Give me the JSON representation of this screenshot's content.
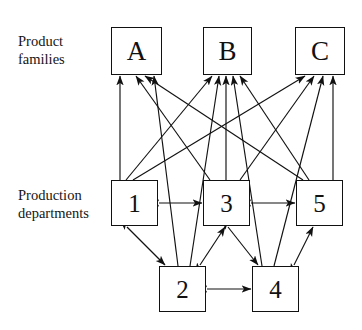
{
  "diagram": {
    "type": "node-link-diagram",
    "background_color": "#ffffff",
    "line_color": "#111111",
    "box_border_color": "#111111",
    "box_fill_color": "#ffffff",
    "row_labels": [
      {
        "id": "label-product-families",
        "text": "Product\nfamilies",
        "x": 18,
        "y": 33
      },
      {
        "id": "label-production-departments",
        "text": "Production\ndepartments",
        "x": 18,
        "y": 187
      }
    ],
    "nodes": [
      {
        "id": "A",
        "label": "A",
        "group": "product-family",
        "x": 111,
        "y": 27,
        "w": 51,
        "h": 48
      },
      {
        "id": "B",
        "label": "B",
        "group": "product-family",
        "x": 203,
        "y": 27,
        "w": 49,
        "h": 48
      },
      {
        "id": "C",
        "label": "C",
        "group": "product-family",
        "x": 295,
        "y": 27,
        "w": 50,
        "h": 48
      },
      {
        "id": "1",
        "label": "1",
        "group": "production-department",
        "x": 111,
        "y": 180,
        "w": 47,
        "h": 46
      },
      {
        "id": "3",
        "label": "3",
        "group": "production-department",
        "x": 203,
        "y": 180,
        "w": 47,
        "h": 46
      },
      {
        "id": "5",
        "label": "5",
        "group": "production-department",
        "x": 296,
        "y": 180,
        "w": 47,
        "h": 46
      },
      {
        "id": "2",
        "label": "2",
        "group": "production-department",
        "x": 159,
        "y": 266,
        "w": 47,
        "h": 46
      },
      {
        "id": "4",
        "label": "4",
        "group": "production-department",
        "x": 252,
        "y": 266,
        "w": 47,
        "h": 46
      }
    ],
    "edges": [
      {
        "from": "1",
        "to": "A",
        "direction": "one-way",
        "x1": 120,
        "y1": 180,
        "x2": 120,
        "y2": 76
      },
      {
        "from": "1",
        "to": "B",
        "direction": "one-way",
        "x1": 126,
        "y1": 180,
        "x2": 212,
        "y2": 76
      },
      {
        "from": "1",
        "to": "C",
        "direction": "one-way",
        "x1": 133,
        "y1": 180,
        "x2": 305,
        "y2": 76
      },
      {
        "from": "3",
        "to": "A",
        "direction": "one-way",
        "x1": 210,
        "y1": 180,
        "x2": 136,
        "y2": 76
      },
      {
        "from": "3",
        "to": "B",
        "direction": "one-way",
        "x1": 226,
        "y1": 180,
        "x2": 226,
        "y2": 76
      },
      {
        "from": "3",
        "to": "C",
        "direction": "one-way",
        "x1": 240,
        "y1": 180,
        "x2": 314,
        "y2": 76
      },
      {
        "from": "5",
        "to": "A",
        "direction": "one-way",
        "x1": 303,
        "y1": 180,
        "x2": 145,
        "y2": 76
      },
      {
        "from": "5",
        "to": "B",
        "direction": "one-way",
        "x1": 309,
        "y1": 180,
        "x2": 240,
        "y2": 76
      },
      {
        "from": "5",
        "to": "C",
        "direction": "one-way",
        "x1": 333,
        "y1": 180,
        "x2": 333,
        "y2": 76
      },
      {
        "from": "2",
        "to": "A",
        "direction": "one-way",
        "x1": 178,
        "y1": 266,
        "x2": 154,
        "y2": 76
      },
      {
        "from": "2",
        "to": "B",
        "direction": "one-way",
        "x1": 190,
        "y1": 266,
        "x2": 219,
        "y2": 76
      },
      {
        "from": "4",
        "to": "B",
        "direction": "one-way",
        "x1": 262,
        "y1": 266,
        "x2": 233,
        "y2": 76
      },
      {
        "from": "4",
        "to": "C",
        "direction": "one-way",
        "x1": 274,
        "y1": 266,
        "x2": 323,
        "y2": 76
      },
      {
        "from": "1",
        "to": "3",
        "direction": "two-way",
        "x1": 159,
        "y1": 203,
        "x2": 202,
        "y2": 203
      },
      {
        "from": "3",
        "to": "5",
        "direction": "two-way",
        "x1": 251,
        "y1": 203,
        "x2": 295,
        "y2": 203
      },
      {
        "from": "2",
        "to": "4",
        "direction": "two-way",
        "x1": 207,
        "y1": 289,
        "x2": 251,
        "y2": 289
      },
      {
        "from": "1",
        "to": "2",
        "direction": "two-way",
        "x1": 127,
        "y1": 227,
        "x2": 165,
        "y2": 265
      },
      {
        "from": "2",
        "to": "3",
        "direction": "two-way",
        "x1": 200,
        "y1": 265,
        "x2": 225,
        "y2": 227
      },
      {
        "from": "3",
        "to": "4",
        "direction": "two-way",
        "x1": 228,
        "y1": 227,
        "x2": 258,
        "y2": 265
      },
      {
        "from": "4",
        "to": "5",
        "direction": "two-way",
        "x1": 294,
        "y1": 265,
        "x2": 313,
        "y2": 227
      }
    ]
  }
}
